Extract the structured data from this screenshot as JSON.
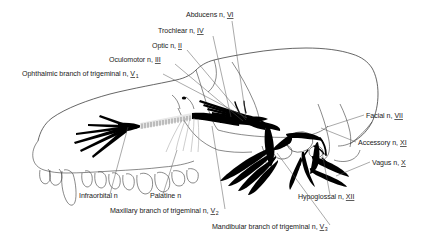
{
  "figure": {
    "background_color": "#ffffff",
    "line_color": "#333333",
    "nerve_color": "#000000",
    "leader_color": "#555555"
  },
  "labels": [
    {
      "id": "abducens",
      "text": "Abducens n,",
      "numeral": "VI",
      "sub": "",
      "x": 186,
      "y": 17,
      "anchor": "start"
    },
    {
      "id": "trochlear",
      "text": "Trochlear n,",
      "numeral": "IV",
      "sub": "",
      "x": 158,
      "y": 33,
      "anchor": "start"
    },
    {
      "id": "optic",
      "text": "Optic n,",
      "numeral": "II",
      "sub": "",
      "x": 152,
      "y": 48,
      "anchor": "start"
    },
    {
      "id": "oculomotor",
      "text": "Oculomotor n,",
      "numeral": "III",
      "sub": "",
      "x": 109,
      "y": 62,
      "anchor": "start"
    },
    {
      "id": "ophthalmic",
      "text": "Ophthalmic branch of trigeminal n,",
      "numeral": "V",
      "sub": "1",
      "x": 22,
      "y": 76,
      "anchor": "start"
    },
    {
      "id": "facial",
      "text": "Facial n,",
      "numeral": "VII",
      "sub": "",
      "x": 366,
      "y": 118,
      "anchor": "start"
    },
    {
      "id": "accessory",
      "text": "Accessory n,",
      "numeral": "XI",
      "sub": "",
      "x": 358,
      "y": 145,
      "anchor": "start"
    },
    {
      "id": "vagus",
      "text": "Vagus n,",
      "numeral": "X",
      "sub": "",
      "x": 372,
      "y": 165,
      "anchor": "start"
    },
    {
      "id": "infraorbital",
      "text": "Infraorbital n",
      "numeral": "",
      "sub": "",
      "x": 79,
      "y": 198,
      "anchor": "start"
    },
    {
      "id": "palatine",
      "text": "Palatine n",
      "numeral": "",
      "sub": "",
      "x": 150,
      "y": 198,
      "anchor": "start"
    },
    {
      "id": "maxillary",
      "text": "Maxillary branch of trigeminal n,",
      "numeral": "V",
      "sub": "2",
      "x": 110,
      "y": 213,
      "anchor": "start"
    },
    {
      "id": "hypoglossal",
      "text": "Hypoglossal n,",
      "numeral": "XII",
      "sub": "",
      "x": 298,
      "y": 199,
      "anchor": "start"
    },
    {
      "id": "mandibular",
      "text": "Mandibular branch of trigeminal n,",
      "numeral": "V",
      "sub": "3",
      "x": 212,
      "y": 229,
      "anchor": "start"
    }
  ],
  "leaders": [
    {
      "id": "abducens-leader",
      "d": "M 232 21 L 246 118"
    },
    {
      "id": "trochlear-leader",
      "d": "M 213 36 L 231 117"
    },
    {
      "id": "optic-leader",
      "d": "M 187 50 L 246 120"
    },
    {
      "id": "oculomotor-leader",
      "d": "M 175 64 L 243 121"
    },
    {
      "id": "ophthalmic-leader",
      "d": "M 163 74 L 247 118"
    },
    {
      "id": "facial-leader",
      "d": "M 364 115 L 327 127"
    },
    {
      "id": "accessory-leader",
      "d": "M 356 142 L 321 128"
    },
    {
      "id": "vagus-leader",
      "d": "M 370 162 L 336 176"
    },
    {
      "id": "infraorbital-leader",
      "d": "M 110 194 L 128 127"
    },
    {
      "id": "palatine-leader",
      "d": "M 163 194 L 177 150"
    },
    {
      "id": "maxillary-leader",
      "d": "M 225 209 L 212 126"
    },
    {
      "id": "hypoglossal-leader",
      "d": "M 330 195 L 322 152"
    },
    {
      "id": "mandibular-leader",
      "d": "M 330 225 L 277 153"
    }
  ]
}
